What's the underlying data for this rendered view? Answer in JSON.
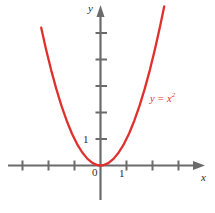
{
  "chart_data": {
    "type": "line",
    "title": "",
    "subtitle": "",
    "xlabel": "x",
    "ylabel": "y",
    "function": "y = x^2",
    "curve_label": "y = x",
    "curve_label_exponent": "2",
    "curve_color": "#e0302e",
    "axis_color": "#6b6b6b",
    "text_color": "#2b2b2b",
    "grid": false,
    "legend_position": "inline-right",
    "xlim": [
      -3.45,
      3.45
    ],
    "ylim": [
      -0.75,
      5.35
    ],
    "x_ticks": [
      -3,
      -2,
      -1,
      0,
      1,
      2,
      3
    ],
    "y_ticks": [
      1,
      2,
      3,
      4,
      5
    ],
    "x_tick_labels": [
      "",
      "",
      "",
      "0",
      "1",
      "",
      ""
    ],
    "y_tick_labels": [
      "1",
      "",
      "",
      "",
      ""
    ],
    "x": [
      -2.28,
      -2.1,
      -1.9,
      -1.7,
      -1.5,
      -1.3,
      -1.1,
      -0.9,
      -0.7,
      -0.5,
      -0.3,
      -0.1,
      0,
      0.1,
      0.3,
      0.5,
      0.7,
      0.9,
      1.1,
      1.3,
      1.5,
      1.7,
      1.9,
      2.1,
      2.3,
      2.45
    ],
    "y": [
      5.2,
      4.41,
      3.61,
      2.89,
      2.25,
      1.69,
      1.21,
      0.81,
      0.49,
      0.25,
      0.09,
      0.01,
      0,
      0.01,
      0.09,
      0.25,
      0.49,
      0.81,
      1.21,
      1.69,
      2.25,
      2.89,
      3.61,
      4.41,
      5.29,
      6.0
    ],
    "series": [
      {
        "name": "y = x^2",
        "color": "#e0302e"
      }
    ],
    "annotations": [
      {
        "text": "y = x²",
        "x": 2.3,
        "y": 3.1,
        "color": "#e0302e"
      },
      {
        "text": "0",
        "x": -0.22,
        "y": -0.45
      },
      {
        "text": "1",
        "x": 1.0,
        "y": -0.48
      },
      {
        "text": "1",
        "x": -0.45,
        "y": 1.0
      }
    ]
  },
  "figure": {
    "y_axis_name": "y",
    "x_axis_name": "x",
    "origin_label": "0",
    "x_one_label": "1",
    "y_one_label": "1",
    "curve_label_base": "y = x",
    "curve_label_sup": "2"
  }
}
